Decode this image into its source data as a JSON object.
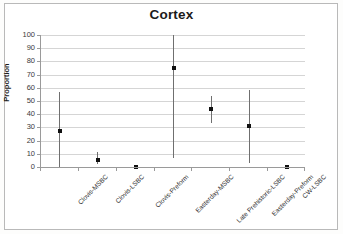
{
  "figure": {
    "border_color": "#b9b9b9",
    "background": "#ffffff"
  },
  "chart_data": {
    "type": "scatter",
    "title": "Cortex",
    "xlabel": "",
    "ylabel": "Proportion",
    "ylim": [
      0,
      100
    ],
    "ytick_labels": [
      "100",
      "90",
      "80",
      "70",
      "60",
      "50",
      "40",
      "30",
      "20",
      "10",
      "0"
    ],
    "ytick_values": [
      100,
      90,
      80,
      70,
      60,
      50,
      40,
      30,
      20,
      10,
      0
    ],
    "grid": true,
    "legend": false,
    "marker_color": "#111111",
    "errorbar_color": "#6f6f6f",
    "categories": [
      "Clovis-MSBC",
      "Clovis-LSBC",
      "Clovis-Preform",
      "Easterday-MSBC",
      "Late Prehistoric-LSBC",
      "Easterday-Preform",
      "CW-LSBC"
    ],
    "values": [
      27,
      5,
      0,
      75,
      44,
      31,
      0
    ],
    "error_low": [
      0,
      2,
      0,
      7,
      33,
      3,
      0
    ],
    "error_high": [
      57,
      11,
      0,
      100,
      54,
      58,
      0
    ],
    "points": [
      {
        "category": "Clovis-MSBC",
        "value": 27,
        "ci_low": 0,
        "ci_high": 57
      },
      {
        "category": "Clovis-LSBC",
        "value": 5,
        "ci_low": 2,
        "ci_high": 11
      },
      {
        "category": "Clovis-Preform",
        "value": 0,
        "ci_low": 0,
        "ci_high": 0
      },
      {
        "category": "Easterday-MSBC",
        "value": 75,
        "ci_low": 7,
        "ci_high": 100
      },
      {
        "category": "Late Prehistoric-LSBC",
        "value": 44,
        "ci_low": 33,
        "ci_high": 54
      },
      {
        "category": "Easterday-Preform",
        "value": 31,
        "ci_low": 3,
        "ci_high": 58
      },
      {
        "category": "CW-LSBC",
        "value": 0,
        "ci_low": 0,
        "ci_high": 0
      }
    ]
  }
}
